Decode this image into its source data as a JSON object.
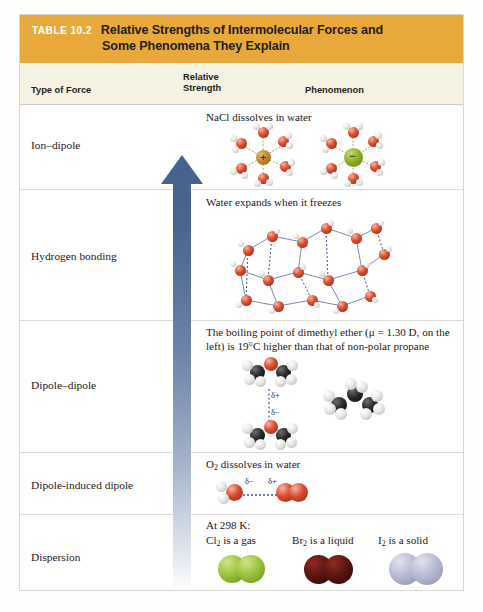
{
  "table": {
    "badge": "TABLE 10.2",
    "title_line1": "Relative Strengths of Intermolecular Forces and",
    "title_line2": "Some Phenomena They Explain",
    "banner_color": "#e8a93a",
    "badge_color": "#ffffff",
    "header_bg": "#f6f2e3",
    "columns": {
      "force": "Type of Force",
      "strength_line1": "Relative",
      "strength_line2": "Strength",
      "phenomenon": "Phenomenon"
    },
    "arrow": {
      "name": "relative-strength-arrow",
      "direction": "up",
      "meaning": "increasing relative strength upward",
      "color_top": "#4a6591",
      "color_bottom": "#ffffff"
    },
    "rows": [
      {
        "force": "Ion–dipole",
        "phenomenon": "NaCl dissolves in water",
        "art": "hydrated-sodium-and-chloride-ions",
        "cation_label": "+",
        "anion_label": "−",
        "cation_color": "#c08530",
        "anion_color": "#8fae2f"
      },
      {
        "force": "Hydrogen bonding",
        "phenomenon": "Water expands when it freezes",
        "art": "ice-lattice-hydrogen-bond-network"
      },
      {
        "force": "Dipole–dipole",
        "phenomenon_line1": "The boiling point of dimethyl ether (μ = 1.30 D, on",
        "phenomenon_line2": "the left) is 19°C higher than that of non-polar propane",
        "art": "dimethyl-ether-pair-and-propane",
        "delta_plus": "δ+",
        "delta_minus": "δ−"
      },
      {
        "force": "Dipole-induced dipole",
        "phenomenon_pre": "O",
        "phenomenon_sub": "2",
        "phenomenon_post": " dissolves in water",
        "art": "water-and-dioxygen-induced-dipole",
        "delta_minus": "δ−",
        "delta_plus": "δ+"
      },
      {
        "force": "Dispersion",
        "condition": "At 298 K:",
        "art": "halogen-diatomic-molecules",
        "items": [
          {
            "formula_pre": "Cl",
            "formula_sub": "2",
            "formula_post": " is a gas",
            "color": "#9cc23e"
          },
          {
            "formula_pre": "Br",
            "formula_sub": "2",
            "formula_post": " is a liquid",
            "color": "#5a1410"
          },
          {
            "formula_pre": "I",
            "formula_sub": "2",
            "formula_post": " is a solid",
            "color": "#b6b9d2"
          }
        ]
      }
    ]
  }
}
